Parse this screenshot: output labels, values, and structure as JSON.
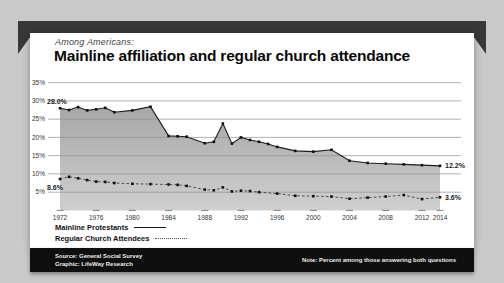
{
  "page": {
    "background": "#c9c9c9",
    "banner_color": "#373737",
    "panel_color": "#ffffff"
  },
  "header": {
    "kicker": "Among Americans:",
    "title": "Mainline affiliation and regular church attendance"
  },
  "legend": {
    "items": [
      {
        "label": "Mainline Protestants",
        "style": "solid"
      },
      {
        "label": "Regular Church Attendees",
        "style": "dotted"
      }
    ]
  },
  "footer": {
    "source_line1": "Source: General Social Survey",
    "source_line2": "Graphic: LifeWay Research",
    "note": "Note: Percent among those answering both questions"
  },
  "chart_data": {
    "type": "area",
    "title": "Mainline affiliation and regular church attendance",
    "subtitle": "Among Americans:",
    "xlabel": "",
    "ylabel": "",
    "ylim": [
      0,
      35
    ],
    "xlim": [
      1972,
      2014
    ],
    "grid": true,
    "legend_position": "bottom-left",
    "y_ticks": [
      {
        "value": 35,
        "label": "35%"
      },
      {
        "value": 30,
        "label": "30%"
      },
      {
        "value": 25,
        "label": "25%"
      },
      {
        "value": 20,
        "label": "20%"
      },
      {
        "value": 15,
        "label": "15%"
      },
      {
        "value": 10,
        "label": "10%"
      },
      {
        "value": 5,
        "label": "5%"
      }
    ],
    "x_ticks": [
      "1972",
      "1976",
      "1980",
      "1984",
      "1988",
      "1992",
      "1996",
      "2000",
      "2004",
      "2008",
      "2012",
      "2014"
    ],
    "x_tick_years": [
      1972,
      1976,
      1980,
      1984,
      1988,
      1992,
      1996,
      2000,
      2004,
      2008,
      2012,
      2014
    ],
    "series": [
      {
        "name": "Mainline Protestants",
        "line": "solid",
        "start_label": "28.0%",
        "end_label": "12.2%",
        "points": [
          [
            1972,
            28.0
          ],
          [
            1973,
            27.5
          ],
          [
            1974,
            28.3
          ],
          [
            1975,
            27.4
          ],
          [
            1976,
            27.7
          ],
          [
            1977,
            28.1
          ],
          [
            1978,
            26.9
          ],
          [
            1980,
            27.4
          ],
          [
            1982,
            28.4
          ],
          [
            1984,
            20.4
          ],
          [
            1985,
            20.3
          ],
          [
            1986,
            20.2
          ],
          [
            1988,
            18.4
          ],
          [
            1989,
            18.8
          ],
          [
            1990,
            23.8
          ],
          [
            1991,
            18.3
          ],
          [
            1992,
            20.0
          ],
          [
            1993,
            19.3
          ],
          [
            1994,
            18.8
          ],
          [
            1995,
            18.2
          ],
          [
            1996,
            17.4
          ],
          [
            1998,
            16.3
          ],
          [
            2000,
            16.1
          ],
          [
            2002,
            16.6
          ],
          [
            2004,
            13.6
          ],
          [
            2006,
            13.0
          ],
          [
            2008,
            12.8
          ],
          [
            2010,
            12.6
          ],
          [
            2012,
            12.4
          ],
          [
            2014,
            12.2
          ]
        ]
      },
      {
        "name": "Regular Church Attendees",
        "line": "dotted",
        "start_label": "8.6%",
        "end_label": "3.6%",
        "points": [
          [
            1972,
            8.6
          ],
          [
            1973,
            9.2
          ],
          [
            1974,
            8.8
          ],
          [
            1975,
            8.3
          ],
          [
            1976,
            7.9
          ],
          [
            1977,
            7.8
          ],
          [
            1978,
            7.5
          ],
          [
            1980,
            7.3
          ],
          [
            1982,
            7.2
          ],
          [
            1984,
            7.1
          ],
          [
            1985,
            7.0
          ],
          [
            1986,
            6.7
          ],
          [
            1988,
            5.7
          ],
          [
            1989,
            5.5
          ],
          [
            1990,
            6.3
          ],
          [
            1991,
            5.2
          ],
          [
            1992,
            5.4
          ],
          [
            1993,
            5.3
          ],
          [
            1994,
            5.0
          ],
          [
            1996,
            4.6
          ],
          [
            1998,
            4.0
          ],
          [
            2000,
            3.9
          ],
          [
            2002,
            3.8
          ],
          [
            2004,
            3.2
          ],
          [
            2006,
            3.5
          ],
          [
            2008,
            3.8
          ],
          [
            2010,
            4.2
          ],
          [
            2012,
            3.1
          ],
          [
            2014,
            3.6
          ]
        ]
      }
    ],
    "colors": {
      "area_fill_top": "#a2a2a2",
      "area_fill_bottom": "#cdcdcd",
      "gridline": "#8f8f8f",
      "mainline": "#1c1c1c",
      "attendees": "#4a4a4a",
      "marker": "#111111",
      "tick_text": "#333333",
      "data_label": "#1a1a1a"
    }
  }
}
